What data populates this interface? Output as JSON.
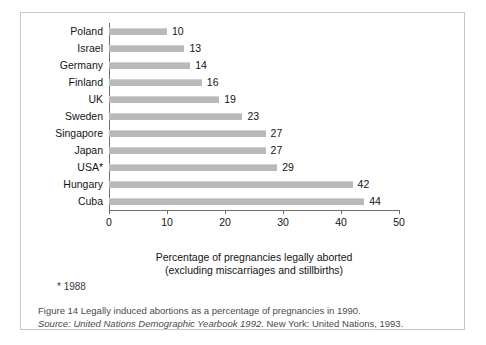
{
  "chart_data": {
    "type": "bar",
    "orientation": "horizontal",
    "title": "",
    "xlabel": "Percentage of pregnancies legally aborted (excluding miscarriages and stillbirths)",
    "xlabel_line1": "Percentage of pregnancies legally aborted",
    "xlabel_line2": "(excluding miscarriages and stillbirths)",
    "ylabel": "",
    "categories": [
      "Poland",
      "Israel",
      "Germany",
      "Finland",
      "UK",
      "Sweden",
      "Singapore",
      "Japan",
      "USA*",
      "Hungary",
      "Cuba"
    ],
    "values": [
      10,
      13,
      14,
      16,
      19,
      23,
      27,
      27,
      29,
      42,
      44
    ],
    "value_labels": [
      "10",
      "13",
      "14",
      "16",
      "19",
      "23",
      "27",
      "27",
      "29",
      "42",
      "44"
    ],
    "xlim": [
      0,
      50
    ],
    "xticks": [
      0,
      10,
      20,
      30,
      40,
      50
    ],
    "xtick_labels": [
      "0",
      "10",
      "20",
      "30",
      "40",
      "50"
    ],
    "grid": false,
    "legend": null,
    "bar_color": "#b9b9b9",
    "axis_color": "#6e6e6e"
  },
  "footnote": {
    "text": "* 1988"
  },
  "caption": {
    "line1": "Figure 14  Legally induced abortions as a percentage of pregnancies in 1990.",
    "line2_source_label": "Source:",
    "line2_title": "United Nations Demographic Yearbook 1992",
    "line2_rest": ". New York: United Nations, 1993."
  },
  "colors": {
    "panel_border": "#c9c9c9",
    "bar": "#b9b9b9",
    "axis": "#6e6e6e",
    "text": "#141414",
    "caption_text": "#4a4a4a"
  }
}
